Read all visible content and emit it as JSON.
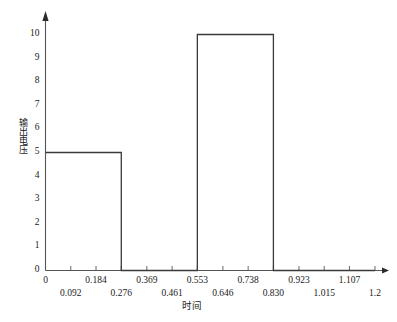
{
  "chart_data": {
    "type": "area",
    "title": "",
    "xlabel": "时间",
    "ylabel": "输出电压",
    "xlim": [
      0,
      1.2
    ],
    "ylim": [
      0,
      10.6
    ],
    "grid": false,
    "legend": null,
    "y_ticks": [
      {
        "value": 10,
        "label": "10"
      },
      {
        "value": 9,
        "label": "9"
      },
      {
        "value": 8,
        "label": "8"
      },
      {
        "value": 7,
        "label": "7"
      },
      {
        "value": 6,
        "label": "6"
      },
      {
        "value": 5,
        "label": "5"
      },
      {
        "value": 4,
        "label": "4"
      },
      {
        "value": 3,
        "label": "3"
      },
      {
        "value": 2,
        "label": "2"
      },
      {
        "value": 1,
        "label": "1"
      },
      {
        "value": 0,
        "label": "0"
      }
    ],
    "x_ticks": [
      {
        "value": 0.0,
        "label": "0",
        "row": 0
      },
      {
        "value": 0.092,
        "label": "0.092",
        "row": 1
      },
      {
        "value": 0.184,
        "label": "0.184",
        "row": 0
      },
      {
        "value": 0.276,
        "label": "0.276",
        "row": 1
      },
      {
        "value": 0.369,
        "label": "0.369",
        "row": 0
      },
      {
        "value": 0.461,
        "label": "0.461",
        "row": 1
      },
      {
        "value": 0.553,
        "label": "0.553",
        "row": 0
      },
      {
        "value": 0.646,
        "label": "0.646",
        "row": 1
      },
      {
        "value": 0.738,
        "label": "0.738",
        "row": 0
      },
      {
        "value": 0.83,
        "label": "0.830",
        "row": 1
      },
      {
        "value": 0.923,
        "label": "0.923",
        "row": 0
      },
      {
        "value": 1.015,
        "label": "1.015",
        "row": 1
      },
      {
        "value": 1.107,
        "label": "1.107",
        "row": 0
      },
      {
        "value": 1.2,
        "label": "1.2",
        "row": 1
      }
    ],
    "pulses": [
      {
        "name": "pulse-1",
        "x_start": 0.0,
        "x_end": 0.276,
        "amplitude": 5
      },
      {
        "name": "pulse-2",
        "x_start": 0.553,
        "x_end": 0.83,
        "amplitude": 10
      }
    ],
    "series": [
      {
        "name": "输出电压",
        "points": [
          {
            "x": 0.0,
            "y": 5
          },
          {
            "x": 0.276,
            "y": 5
          },
          {
            "x": 0.276,
            "y": 0
          },
          {
            "x": 0.553,
            "y": 0
          },
          {
            "x": 0.553,
            "y": 10
          },
          {
            "x": 0.83,
            "y": 10
          },
          {
            "x": 0.83,
            "y": 0
          },
          {
            "x": 1.2,
            "y": 0
          }
        ]
      }
    ],
    "colors": {
      "axis": "#555555",
      "trace": "#3a3a3a",
      "background": "#ffffff",
      "text": "#1a1a1a"
    }
  }
}
